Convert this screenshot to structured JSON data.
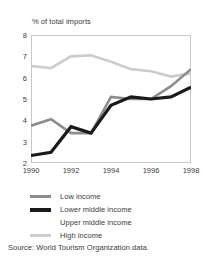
{
  "chart_data": {
    "type": "line",
    "title": "",
    "ylabel": "% of total imports",
    "xlabel": "",
    "ylim": [
      2,
      8
    ],
    "xlim": [
      1990,
      1998
    ],
    "yticks": [
      "8",
      "7",
      "6",
      "5",
      "4",
      "3",
      "2"
    ],
    "ytick_values": [
      8,
      7,
      6,
      5,
      4,
      3,
      2
    ],
    "xticks": [
      "1990",
      "1992",
      "1994",
      "1996",
      "1998"
    ],
    "xtick_values": [
      1990,
      1992,
      1994,
      1996,
      1998
    ],
    "x": [
      1990,
      1991,
      1992,
      1993,
      1994,
      1995,
      1996,
      1997,
      1998
    ],
    "grid": false,
    "legend_position": "below",
    "series": [
      {
        "name": "Low income",
        "color": "#8c8c8c",
        "width": 2.6,
        "values": [
          3.75,
          4.05,
          3.4,
          3.4,
          5.1,
          5.0,
          5.0,
          5.6,
          6.4
        ]
      },
      {
        "name": "Lower middle income",
        "color": "#1a1a1a",
        "width": 3.2,
        "values": [
          2.35,
          2.5,
          3.7,
          3.4,
          4.7,
          5.1,
          5.0,
          5.1,
          5.55
        ]
      },
      {
        "name": "Upper middle income",
        "color": "#ffffff",
        "width": 2.6,
        "values": [
          null,
          null,
          null,
          null,
          null,
          null,
          null,
          null,
          null
        ]
      },
      {
        "name": "High income",
        "color": "#cccccc",
        "width": 2.6,
        "values": [
          6.55,
          6.45,
          7.0,
          7.05,
          6.75,
          6.4,
          6.3,
          6.05,
          6.2
        ]
      }
    ],
    "source": "Source: World Tourism Organization data."
  },
  "legend": {
    "items": [
      {
        "label": "Low income"
      },
      {
        "label": "Lower middle income"
      },
      {
        "label": "Upper middle income"
      },
      {
        "label": "High income"
      }
    ]
  },
  "colors": {
    "low_income": "#8c8c8c",
    "lower_middle_income": "#1a1a1a",
    "upper_middle_income": "#ffffff",
    "high_income": "#cccccc",
    "axis": "#c8c8c8",
    "text": "#3b3b3b"
  }
}
